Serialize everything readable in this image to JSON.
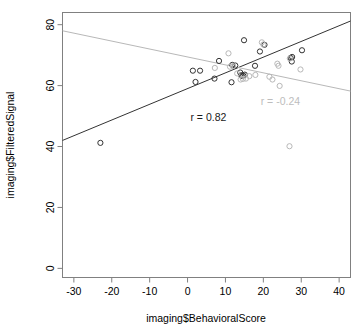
{
  "chart_data": {
    "type": "scatter",
    "title": "",
    "xlabel": "imaging$BehavioralScore",
    "ylabel": "imaging$FilteredSignal",
    "xlim": [
      -33,
      43
    ],
    "ylim": [
      -3,
      84
    ],
    "xticks": [
      -30,
      -20,
      -10,
      0,
      10,
      20,
      30,
      40
    ],
    "yticks": [
      0,
      20,
      40,
      60,
      80
    ],
    "xtick_labels": [
      "-30",
      "-20",
      "-10",
      "0",
      "10",
      "20",
      "30",
      "40"
    ],
    "ytick_labels": [
      "0",
      "20",
      "40",
      "60",
      "80"
    ],
    "grid": false,
    "legend": "none",
    "box": true,
    "series": [
      {
        "name": "black-points",
        "color": "#333333",
        "marker": "open-circle",
        "points": [
          [
            -23.0,
            41.2
          ],
          [
            1.4,
            64.9
          ],
          [
            2.1,
            61.2
          ],
          [
            3.3,
            64.9
          ],
          [
            7.1,
            62.3
          ],
          [
            8.3,
            68.1
          ],
          [
            11.6,
            61.1
          ],
          [
            11.8,
            66.8
          ],
          [
            12.6,
            66.6
          ],
          [
            13.9,
            64.3
          ],
          [
            14.2,
            63.4
          ],
          [
            14.3,
            63.2
          ],
          [
            14.7,
            63.3
          ],
          [
            14.9,
            74.9
          ],
          [
            15.1,
            63.6
          ],
          [
            17.8,
            66.5
          ],
          [
            19.1,
            71.2
          ],
          [
            20.3,
            73.4
          ],
          [
            27.2,
            69.1
          ],
          [
            27.5,
            67.9
          ],
          [
            27.6,
            69.4
          ],
          [
            30.2,
            71.6
          ]
        ]
      },
      {
        "name": "gray-points",
        "color": "#b8b8b8",
        "marker": "open-circle",
        "points": [
          [
            7.2,
            65.8
          ],
          [
            10.8,
            70.6
          ],
          [
            11.2,
            66.2
          ],
          [
            12.0,
            66.4
          ],
          [
            13.1,
            64.0
          ],
          [
            14.0,
            62.0
          ],
          [
            14.6,
            62.2
          ],
          [
            15.4,
            62.3
          ],
          [
            16.3,
            63.1
          ],
          [
            17.9,
            63.5
          ],
          [
            19.6,
            74.2
          ],
          [
            20.0,
            73.5
          ],
          [
            21.6,
            62.9
          ],
          [
            22.4,
            62.0
          ],
          [
            23.7,
            67.2
          ],
          [
            24.0,
            66.5
          ],
          [
            24.3,
            59.9
          ],
          [
            26.9,
            40.1
          ],
          [
            27.0,
            68.9
          ],
          [
            29.8,
            65.3
          ]
        ]
      }
    ],
    "fits": [
      {
        "name": "black-regression-line",
        "color": "#333333",
        "label": "r = 0.82",
        "label_x": 5.5,
        "label_y": 48.5,
        "x0": -33,
        "y0": 42.0,
        "x1": 43,
        "y1": 81.2
      },
      {
        "name": "gray-regression-line",
        "color": "#b8b8b8",
        "label": "r = -0.24",
        "label_x": 24.5,
        "label_y": 53.6,
        "x0": -33,
        "y0": 78.0,
        "x1": 43,
        "y1": 58.2
      }
    ],
    "annotations": [
      {
        "text": "r = 0.82",
        "color": "#1a1a1a"
      },
      {
        "text": "r = -0.24",
        "color": "#bdbdbd"
      }
    ]
  },
  "style": {
    "box_color": "#808080",
    "axis_color": "#808080",
    "tick_text_color": "#000000",
    "background": "#ffffff",
    "black_series_color": "#333333",
    "gray_series_color": "#b8b8b8"
  }
}
